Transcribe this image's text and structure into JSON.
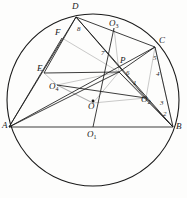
{
  "figure": {
    "stroke_color": "#1a1a1a",
    "faint_color": "#8d8d8d",
    "circle": {
      "cx": 93,
      "cy": 100,
      "r": 86
    },
    "points": [
      {
        "id": "A",
        "label": "A",
        "sub": "",
        "x": 9,
        "y": 127,
        "lx": 2,
        "ly": 127,
        "kind": "vertex"
      },
      {
        "id": "B",
        "label": "B",
        "sub": "",
        "x": 173,
        "y": 127,
        "lx": 176,
        "ly": 128,
        "kind": "vertex"
      },
      {
        "id": "C",
        "label": "C",
        "sub": "",
        "x": 155,
        "y": 47,
        "lx": 159,
        "ly": 42,
        "kind": "vertex"
      },
      {
        "id": "D",
        "label": "D",
        "sub": "",
        "x": 76,
        "y": 17,
        "lx": 72,
        "ly": 8,
        "kind": "vertex"
      },
      {
        "id": "E",
        "label": "E",
        "sub": "",
        "x": 44,
        "y": 73,
        "lx": 37,
        "ly": 70,
        "kind": "vertex"
      },
      {
        "id": "F",
        "label": "F",
        "sub": "",
        "x": 62,
        "y": 38,
        "lx": 55,
        "ly": 34,
        "kind": "vertex"
      },
      {
        "id": "P",
        "label": "P",
        "sub": "",
        "x": 119,
        "y": 72,
        "lx": 120,
        "ly": 62,
        "kind": "interior"
      },
      {
        "id": "O",
        "label": "O",
        "sub": "",
        "x": 93,
        "y": 103,
        "lx": 88,
        "ly": 108,
        "kind": "center-dot"
      },
      {
        "id": "O1",
        "label": "O",
        "sub": "1",
        "x": 93,
        "y": 127,
        "lx": 87,
        "ly": 136,
        "kind": "center"
      },
      {
        "id": "O2",
        "label": "O",
        "sub": "2",
        "x": 146,
        "y": 98,
        "lx": 141,
        "ly": 101,
        "kind": "center"
      },
      {
        "id": "O3",
        "label": "O",
        "sub": "3",
        "x": 114,
        "y": 28,
        "lx": 109,
        "ly": 25,
        "kind": "center"
      },
      {
        "id": "O4",
        "label": "O",
        "sub": "4",
        "x": 57,
        "y": 85,
        "lx": 49,
        "ly": 88,
        "kind": "center"
      }
    ],
    "numbered_labels": [
      {
        "id": "n1",
        "text": "1",
        "x": 133,
        "y": 85
      },
      {
        "id": "n2",
        "text": "2",
        "x": 163,
        "y": 116
      },
      {
        "id": "n3",
        "text": "3",
        "x": 160,
        "y": 105
      },
      {
        "id": "n4",
        "text": "4",
        "x": 156,
        "y": 76
      },
      {
        "id": "n5",
        "text": "5",
        "x": 153,
        "y": 60
      },
      {
        "id": "n6",
        "text": "6",
        "x": 126,
        "y": 75
      },
      {
        "id": "n7",
        "text": "7",
        "x": 101,
        "y": 55
      },
      {
        "id": "n8",
        "text": "8",
        "x": 77,
        "y": 31
      }
    ],
    "solid_segments": [
      {
        "id": "A-B",
        "from": "A",
        "to": "B"
      },
      {
        "id": "A-D",
        "from": "A",
        "to": "D"
      },
      {
        "id": "A-C",
        "from": "A",
        "to": "C"
      },
      {
        "id": "A-F",
        "from": "A",
        "to": "F"
      },
      {
        "id": "A-P",
        "from": "A",
        "to": "P"
      },
      {
        "id": "D-C",
        "from": "D",
        "to": "C"
      },
      {
        "id": "D-B",
        "from": "D",
        "to": "B"
      },
      {
        "id": "D-O2",
        "from": "D",
        "to": "O2"
      },
      {
        "id": "C-B",
        "from": "C",
        "to": "B"
      },
      {
        "id": "C-P",
        "from": "C",
        "to": "P"
      },
      {
        "id": "E-P",
        "from": "E",
        "to": "P"
      },
      {
        "id": "E-D",
        "from": "E",
        "to": "D"
      },
      {
        "id": "B-P",
        "from": "B",
        "to": "P"
      },
      {
        "id": "O3-O1",
        "from": "O3",
        "to": "O1"
      },
      {
        "id": "O2-B",
        "from": "O2",
        "to": "B"
      },
      {
        "id": "O4-O2",
        "from": "O4",
        "to": "O2"
      }
    ],
    "faint_segments": [
      {
        "id": "F-P",
        "from": "F",
        "to": "P"
      },
      {
        "id": "O4-P",
        "from": "O4",
        "to": "P"
      },
      {
        "id": "O4-E",
        "from": "O4",
        "to": "E"
      },
      {
        "id": "O-O4",
        "from": "O",
        "to": "O4"
      },
      {
        "id": "O-O2",
        "from": "O",
        "to": "O2"
      },
      {
        "id": "O-P",
        "from": "O",
        "to": "P"
      },
      {
        "id": "P-O2",
        "from": "P",
        "to": "O2"
      },
      {
        "id": "P-O3",
        "from": "P",
        "to": "O3"
      },
      {
        "id": "O2-C",
        "from": "O2",
        "to": "C"
      },
      {
        "id": "C-Bf",
        "from": "C",
        "to": "B"
      },
      {
        "id": "O4-Of",
        "from": "O4",
        "to": "O"
      }
    ]
  }
}
